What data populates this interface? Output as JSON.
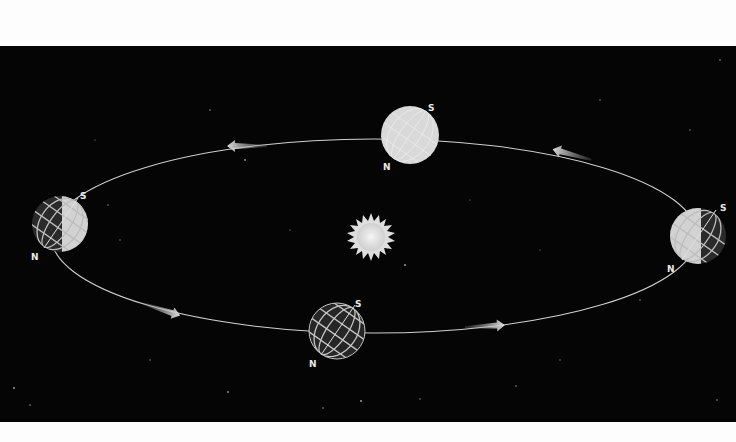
{
  "figure": {
    "background": "#050505",
    "margin_color": "#fdfdfd"
  },
  "orbit": {
    "cx": 374,
    "cy": 236,
    "rx": 323,
    "ry": 97,
    "color": "#cfcfcf"
  },
  "sun": {
    "cx": 371,
    "cy": 237,
    "label_icon": "sun-icon"
  },
  "earths": [
    {
      "id": "top",
      "cx": 410,
      "cy": 135,
      "r": 29,
      "shading": "lit",
      "pole_s": "S",
      "pole_n": "N"
    },
    {
      "id": "left",
      "cx": 60,
      "cy": 224,
      "r": 28,
      "shading": "half-right-lit",
      "pole_s": "S",
      "pole_n": "N"
    },
    {
      "id": "right",
      "cx": 698,
      "cy": 236,
      "r": 28,
      "shading": "half-left-lit",
      "pole_s": "S",
      "pole_n": "N"
    },
    {
      "id": "bottom",
      "cx": 337,
      "cy": 331,
      "r": 28,
      "shading": "dark",
      "pole_s": "S",
      "pole_n": "N"
    }
  ],
  "arrows": [
    {
      "id": "top-left",
      "x": 245,
      "y": 146,
      "direction": "left"
    },
    {
      "id": "top-right",
      "x": 570,
      "y": 154,
      "direction": "left-up"
    },
    {
      "id": "bottom-left",
      "x": 160,
      "y": 309,
      "direction": "right-down"
    },
    {
      "id": "bottom-right",
      "x": 487,
      "y": 326,
      "direction": "right"
    }
  ],
  "labels": {
    "top_s": "S",
    "top_n": "N",
    "left_s": "S",
    "left_n": "N",
    "right_s": "S",
    "right_n": "N",
    "bottom_s": "S",
    "bottom_n": "N"
  }
}
